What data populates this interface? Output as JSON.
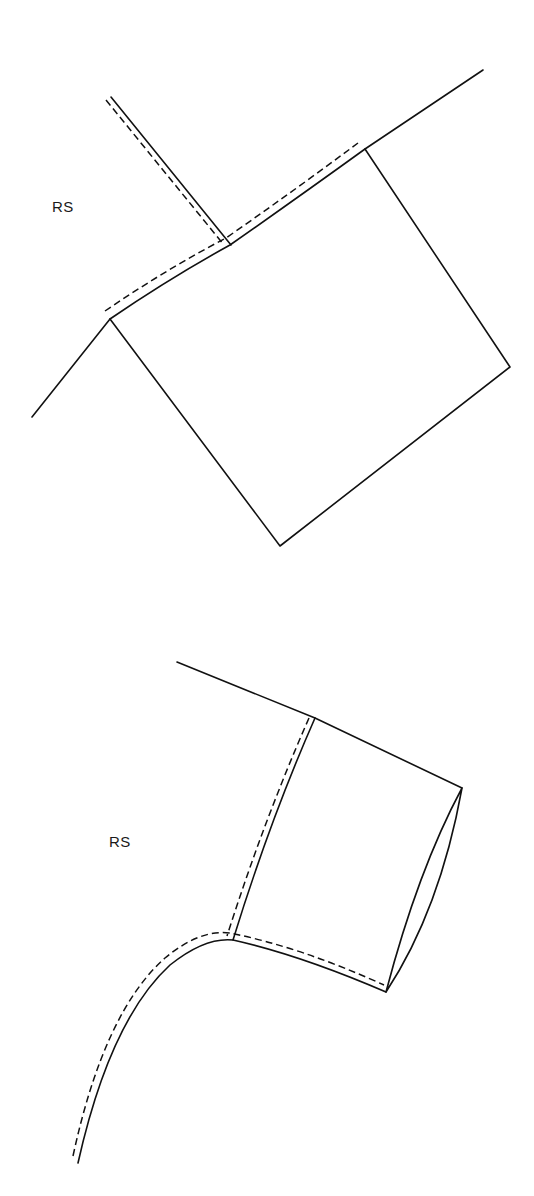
{
  "figures": [
    {
      "id": "cuff-flat",
      "label": "RS",
      "label_position": {
        "x": 52,
        "y": 198
      }
    },
    {
      "id": "cuff-sewn",
      "label": "RS",
      "label_position": {
        "x": 109,
        "y": 833
      }
    }
  ],
  "colors": {
    "line": "#111111",
    "background": "#ffffff"
  }
}
